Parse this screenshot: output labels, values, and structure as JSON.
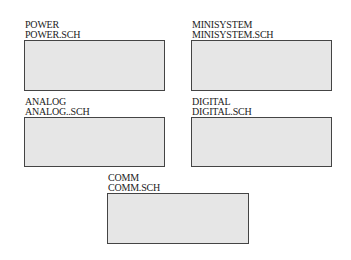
{
  "sheets": [
    {
      "name": "POWER",
      "file": "POWER.SCH"
    },
    {
      "name": "MINISYSTEM",
      "file": "MINISYSTEM.SCH"
    },
    {
      "name": "ANALOG",
      "file": "ANALOG..SCH"
    },
    {
      "name": "DIGITAL",
      "file": "DIGITAL.SCH"
    },
    {
      "name": "COMM",
      "file": "COMM.SCH"
    }
  ],
  "colors": {
    "box_fill": "#e6e6e6",
    "box_border": "#444444",
    "text": "#222222"
  }
}
